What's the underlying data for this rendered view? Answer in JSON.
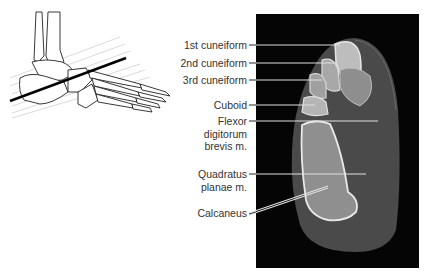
{
  "figure": {
    "inset_drawing": {
      "description": "Lateral view of foot skeleton with oblique scan plane line",
      "scan_plane_color": "#000000"
    },
    "ct_image": {
      "background": "#050505",
      "description": "Axial CT slice through foot"
    },
    "labels": [
      {
        "id": "first-cuneiform",
        "lines": [
          "1st cuneiform"
        ]
      },
      {
        "id": "second-cuneiform",
        "lines": [
          "2nd cuneiform"
        ]
      },
      {
        "id": "third-cuneiform",
        "lines": [
          "3rd cuneiform"
        ]
      },
      {
        "id": "cuboid",
        "lines": [
          "Cuboid"
        ]
      },
      {
        "id": "flexor-digitorum-brevis",
        "lines": [
          "Flexor",
          "digitorum",
          "brevis m."
        ]
      },
      {
        "id": "quadratus-planae",
        "lines": [
          "Quadratus",
          "planae m."
        ]
      },
      {
        "id": "calcaneus",
        "lines": [
          "Calcaneus"
        ]
      }
    ],
    "colors": {
      "text": "#333333",
      "leader_line": "#dddddd",
      "bone": "#d9d9d9",
      "soft_tissue": "#4a4a4a"
    }
  }
}
